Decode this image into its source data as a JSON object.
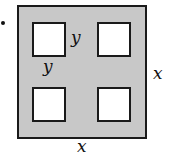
{
  "figure": {
    "colors": {
      "sheet_fill": "#c8c8c8",
      "outline": "#1a1a1a",
      "cutout_fill": "#ffffff"
    },
    "labels": {
      "cutout_side_right": "y",
      "cutout_side_bottom": "y",
      "outer_side_right": "x",
      "outer_side_bottom": "x"
    },
    "cutouts": [
      {
        "position": "top-left"
      },
      {
        "position": "top-right"
      },
      {
        "position": "bottom-left"
      },
      {
        "position": "bottom-right"
      }
    ]
  }
}
